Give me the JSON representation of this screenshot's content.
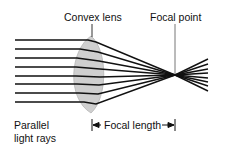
{
  "diagram": {
    "labels": {
      "lens": "Convex lens",
      "focal_point": "Focal point",
      "parallel_line1": "Parallel",
      "parallel_line2": "light rays",
      "focal_length": "Focal length"
    },
    "colors": {
      "ray": "#111111",
      "lens_fill": "#cfcfcf",
      "lens_stroke": "#b5b5b5",
      "pointer": "#333333"
    },
    "ray_count": 8
  }
}
